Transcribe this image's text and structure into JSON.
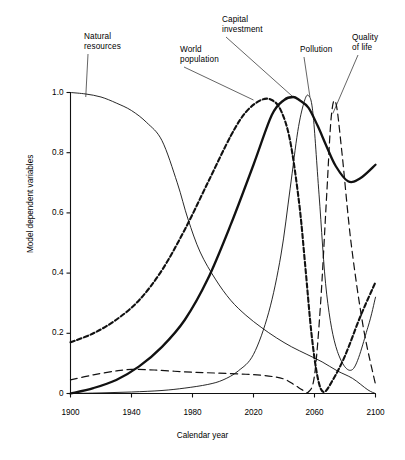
{
  "chart_data": {
    "type": "line",
    "title": "",
    "xlabel": "Calendar year",
    "ylabel": "Model dependent variables",
    "xlim": [
      1900,
      2100
    ],
    "ylim": [
      0,
      1.05
    ],
    "xticks": [
      "1900",
      "1940",
      "1980",
      "2020",
      "2060",
      "2100"
    ],
    "xtick_values": [
      1900,
      1940,
      1980,
      2020,
      2060,
      2100
    ],
    "yticks": [
      "0",
      "0.2",
      "0.4",
      "0.6",
      "0.8",
      "1.0"
    ],
    "ytick_values": [
      0,
      0.2,
      0.4,
      0.6,
      0.8,
      1.0
    ],
    "grid": false,
    "legend_position": "annotations-with-leader-lines",
    "series": [
      {
        "name": "Natural resources",
        "style": "thin-solid",
        "x": [
          1900,
          1910,
          1920,
          1930,
          1940,
          1950,
          1960,
          1970,
          1977,
          1985,
          1995,
          2005,
          2015,
          2025,
          2035,
          2045,
          2055,
          2065,
          2075,
          2085,
          2095,
          2100
        ],
        "values": [
          1.0,
          0.995,
          0.985,
          0.965,
          0.94,
          0.9,
          0.84,
          0.7,
          0.58,
          0.47,
          0.38,
          0.31,
          0.26,
          0.22,
          0.185,
          0.155,
          0.13,
          0.105,
          0.075,
          0.05,
          0.012,
          0.0
        ]
      },
      {
        "name": "World population",
        "style": "heavy-short-dash",
        "x": [
          1900,
          1915,
          1930,
          1945,
          1960,
          1975,
          1990,
          2005,
          2015,
          2025,
          2032,
          2038,
          2044,
          2050,
          2054,
          2058,
          2062,
          2066,
          2072,
          2080,
          2090,
          2100
        ],
        "values": [
          0.17,
          0.2,
          0.245,
          0.31,
          0.41,
          0.545,
          0.7,
          0.855,
          0.935,
          0.975,
          0.975,
          0.94,
          0.84,
          0.63,
          0.42,
          0.2,
          0.055,
          0.005,
          0.045,
          0.125,
          0.255,
          0.37
        ]
      },
      {
        "name": "Capital investment",
        "style": "thick-solid",
        "x": [
          1900,
          1915,
          1930,
          1945,
          1960,
          1975,
          1990,
          2005,
          2020,
          2032,
          2040,
          2046,
          2050,
          2056,
          2062,
          2068,
          2074,
          2082,
          2090,
          2100
        ],
        "values": [
          0.0,
          0.018,
          0.045,
          0.09,
          0.155,
          0.245,
          0.38,
          0.56,
          0.76,
          0.925,
          0.975,
          0.985,
          0.975,
          0.95,
          0.89,
          0.82,
          0.755,
          0.705,
          0.715,
          0.76
        ]
      },
      {
        "name": "Pollution",
        "style": "thin-solid",
        "x": [
          1900,
          1920,
          1940,
          1960,
          1975,
          1990,
          2000,
          2010,
          2020,
          2030,
          2038,
          2044,
          2049,
          2053,
          2056,
          2059,
          2063,
          2068,
          2075,
          2085,
          2095,
          2100
        ],
        "values": [
          0.0,
          0.002,
          0.005,
          0.01,
          0.018,
          0.03,
          0.045,
          0.075,
          0.13,
          0.27,
          0.46,
          0.68,
          0.87,
          0.965,
          0.99,
          0.93,
          0.66,
          0.33,
          0.14,
          0.08,
          0.22,
          0.32
        ]
      },
      {
        "name": "Quality of life",
        "style": "long-dash",
        "x": [
          1900,
          1915,
          1930,
          1940,
          1955,
          1975,
          1995,
          2015,
          2030,
          2040,
          2047,
          2052,
          2056,
          2060,
          2064,
          2068,
          2071,
          2074,
          2078,
          2084,
          2092,
          2100
        ],
        "values": [
          0.045,
          0.062,
          0.075,
          0.08,
          0.078,
          0.072,
          0.068,
          0.064,
          0.058,
          0.048,
          0.028,
          0.012,
          0.005,
          0.06,
          0.3,
          0.66,
          0.92,
          0.965,
          0.8,
          0.5,
          0.22,
          0.03
        ]
      }
    ],
    "annotations": [
      {
        "label": "Natural\nresources",
        "x": 1910,
        "y": 0.985
      },
      {
        "label": "World\npopulation",
        "x": 2020,
        "y": 0.975
      },
      {
        "label": "Capital\ninvestment",
        "x": 2046,
        "y": 0.985
      },
      {
        "label": "Pollution",
        "x": 2057,
        "y": 0.985
      },
      {
        "label": "Quality\nof life",
        "x": 2072,
        "y": 0.93
      }
    ]
  }
}
